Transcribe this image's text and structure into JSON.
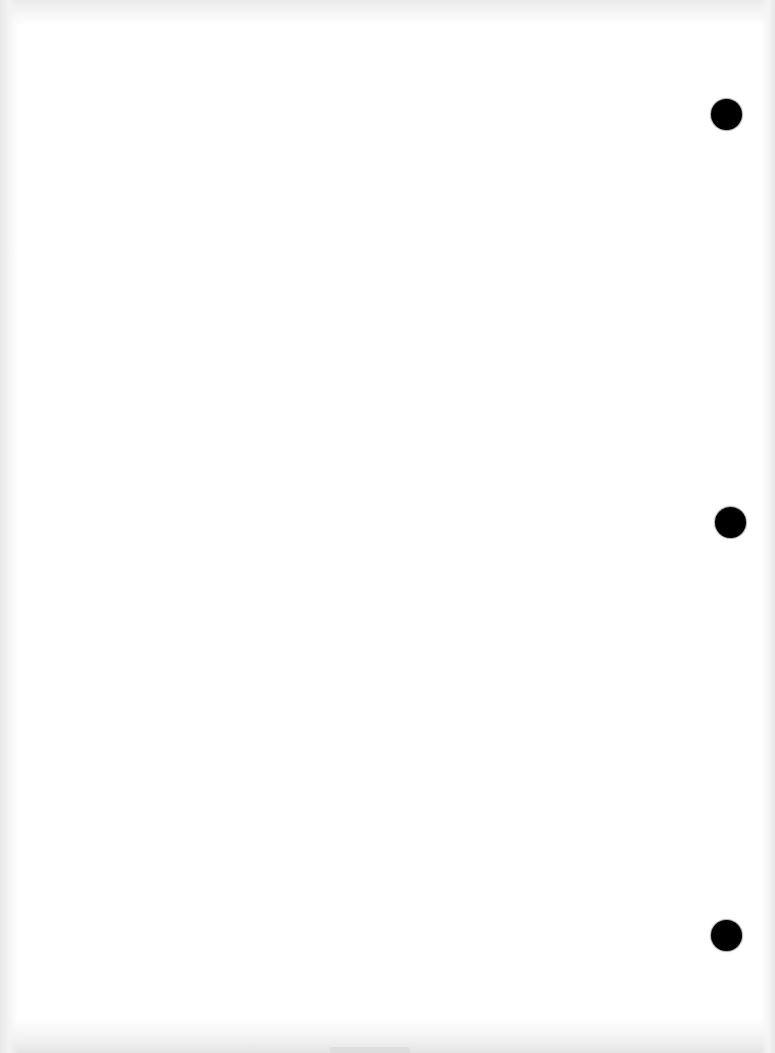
{
  "page": {
    "type": "blank scanned sheet",
    "background_color": "#ffffff",
    "text": ""
  },
  "punch_holes": [
    {
      "name": "top",
      "cx": 726,
      "cy": 114,
      "diameter": 31,
      "color": "#000000"
    },
    {
      "name": "middle",
      "cx": 730,
      "cy": 522,
      "diameter": 31,
      "color": "#000000"
    },
    {
      "name": "bottom",
      "cx": 726,
      "cy": 935,
      "diameter": 31,
      "color": "#000000"
    }
  ]
}
